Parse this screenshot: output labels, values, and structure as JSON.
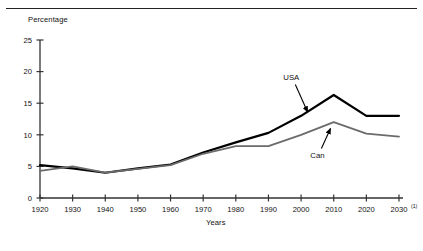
{
  "figure": {
    "top_rule": true,
    "y_axis_title": "Percentage",
    "x_axis_title": "Years",
    "footnote_marker": "(1)"
  },
  "chart_data": {
    "type": "line",
    "title": "",
    "xlabel": "Years",
    "ylabel": "Percentage",
    "x": [
      1920,
      1930,
      1940,
      1950,
      1960,
      1970,
      1980,
      1990,
      2000,
      2010,
      2020,
      2030
    ],
    "xlim": [
      1920,
      2030
    ],
    "ylim": [
      0,
      25
    ],
    "yticks": [
      0,
      5,
      10,
      15,
      20,
      25
    ],
    "ytick_labels": [
      "0",
      "5",
      "10",
      "15",
      "20",
      "25"
    ],
    "xticks": [
      1920,
      1930,
      1940,
      1950,
      1960,
      1970,
      1980,
      1990,
      2000,
      2010,
      2020,
      2030
    ],
    "xtick_labels": [
      "1920",
      "1930",
      "1940",
      "1950",
      "1960",
      "1970",
      "1980",
      "1990",
      "2000",
      "2010",
      "2020",
      "2030"
    ],
    "last_xtick_footnote": "(1)",
    "grid": false,
    "legend": "annotated-labels",
    "series": [
      {
        "name": "USA",
        "color": "#000000",
        "linewidth": 2.2,
        "values": [
          5.2,
          4.7,
          4.0,
          4.7,
          5.3,
          7.2,
          8.8,
          10.3,
          13.0,
          16.3,
          13.0,
          13.0
        ],
        "annotation": {
          "label": "USA",
          "x": 1997,
          "y": 18.6,
          "arrow_to_x": 2002,
          "arrow_to_y": 13.6
        }
      },
      {
        "name": "Can",
        "color": "#6b6b6b",
        "linewidth": 1.8,
        "values": [
          4.3,
          5.0,
          4.0,
          4.6,
          5.2,
          7.0,
          8.2,
          8.2,
          10.0,
          12.0,
          10.2,
          9.7
        ],
        "annotation": {
          "label": "Can",
          "x": 2005,
          "y": 6.4,
          "arrow_to_x": 2009,
          "arrow_to_y": 11.0
        }
      }
    ]
  }
}
